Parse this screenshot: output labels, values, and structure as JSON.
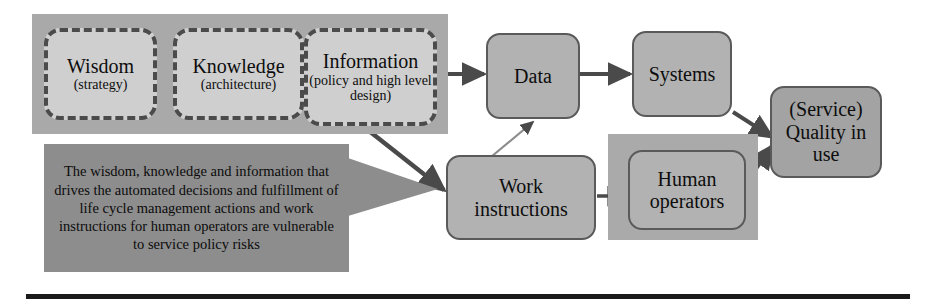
{
  "diagram": {
    "colors": {
      "band_gray": "#a9a9a9",
      "stage_fill": "#cfcfcf",
      "stage_border": "#4b4b4b",
      "process_fill": "#b2b2b2",
      "process_fill_dark": "#a3a3a3",
      "process_border": "#5a5a5a",
      "callout_fill": "#8d8d8d",
      "arrow": "#4a4a4a",
      "text": "#0d0d0d",
      "rule": "#1a1a1a",
      "page_background": "#ffffff"
    },
    "stages": [
      {
        "id": "wisdom",
        "title": "Wisdom",
        "sub": "(strategy)"
      },
      {
        "id": "knowledge",
        "title": "Knowledge",
        "sub": "(architecture)"
      },
      {
        "id": "information",
        "title": "Information",
        "sub": "(policy and high level design)"
      }
    ],
    "processes": [
      {
        "id": "data",
        "label": "Data"
      },
      {
        "id": "systems",
        "label": "Systems"
      },
      {
        "id": "work-instructions",
        "label": "Work instructions"
      },
      {
        "id": "human-operators",
        "label": "Human operators"
      },
      {
        "id": "service-quality",
        "label": "(Service) Quality in use"
      }
    ],
    "callout": {
      "id": "risk-callout",
      "text": "The wisdom, knowledge and information that drives the automated decisions and fulfillment of life cycle management actions and work instructions for human operators are vulnerable to service policy risks"
    },
    "connections": [
      {
        "from": "wisdom",
        "to": "knowledge"
      },
      {
        "from": "knowledge",
        "to": "information"
      },
      {
        "from": "information",
        "to": "data"
      },
      {
        "from": "information",
        "to": "work-instructions"
      },
      {
        "from": "work-instructions",
        "to": "data"
      },
      {
        "from": "data",
        "to": "systems"
      },
      {
        "from": "work-instructions",
        "to": "human-operators"
      },
      {
        "from": "systems",
        "to": "service-quality"
      },
      {
        "from": "human-operators",
        "to": "service-quality"
      },
      {
        "from": "risk-callout",
        "to": "work-instructions"
      }
    ]
  }
}
